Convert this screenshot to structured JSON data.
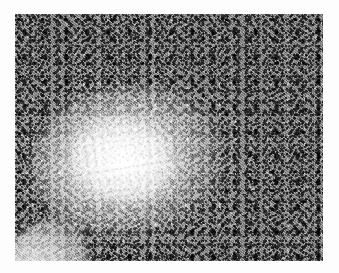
{
  "image": {
    "kind": "histopathology-micrograph",
    "staining": "hematoxylin and eosin",
    "color_mode": "grayscale",
    "width_px": 339,
    "height_px": 273,
    "content_bounds": {
      "left": 15,
      "top": 14,
      "width": 308,
      "height": 247
    },
    "background_color": "#fdfdfd",
    "alt_text": "Grayscale histology micrograph of lymphoid tissue showing a pale germinal center surrounded by a dark, densely packed mantle zone of small lymphocytes."
  },
  "regions": [
    {
      "name": "germinal-center",
      "label": "Pale germinal center (follicle)",
      "tone": "light",
      "mean_gray": "#dedede"
    },
    {
      "name": "mantle-zone",
      "label": "Dark mantle zone of small lymphocytes",
      "tone": "dark",
      "mean_gray": "#8f8f8f"
    },
    {
      "name": "tissue-edge",
      "label": "Light tissue edge at lower-left corner",
      "tone": "light",
      "mean_gray": "#ededed"
    }
  ],
  "palette": {
    "background": "#fdfdfd",
    "tissue_mid": "#9a9a9a",
    "nuclei_dark": "#242424",
    "follicle_light": "#e8e8e8",
    "highlight": "#ffffff"
  }
}
